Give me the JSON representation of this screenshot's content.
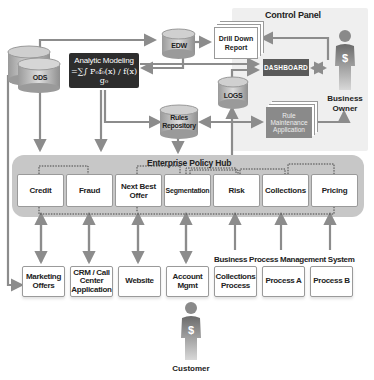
{
  "control_panel": {
    "title": "Control Panel",
    "drill_down_report": "Drill Down Report",
    "dashboard": "DASHBOARD",
    "rule_maintenance_application": "Rule Maintenance Application"
  },
  "data_stores": {
    "ods": "ODS",
    "edw": "EDW",
    "logs": "LOGS",
    "rules_repository": "Rules Repository"
  },
  "analytic_modeling": {
    "title": "Analytic Modeling",
    "formula": "=∑∫ P₀f₀(x) / f(x) g₀"
  },
  "actors": {
    "business_owner": "Business Owner",
    "customer": "Customer"
  },
  "policy_hub": {
    "title": "Enterprise Policy Hub",
    "modules": [
      "Credit",
      "Fraud",
      "Next Best Offer",
      "Segmentation",
      "Risk",
      "Collections",
      "Pricing"
    ]
  },
  "channels": [
    "Marketing Offers",
    "CRM / Call Center Application",
    "Website",
    "Account Mgmt"
  ],
  "bpms": {
    "title": "Business Process Management System",
    "processes": [
      "Collections Process",
      "Process A",
      "Process B"
    ]
  },
  "colors": {
    "arrow": "#8c8c8c",
    "panel_bg": "#efefef",
    "hub_bg": "#c7c7c7",
    "analytic_bg": "#2d2d2d",
    "dashboard_bg": "#5a5a5a"
  }
}
